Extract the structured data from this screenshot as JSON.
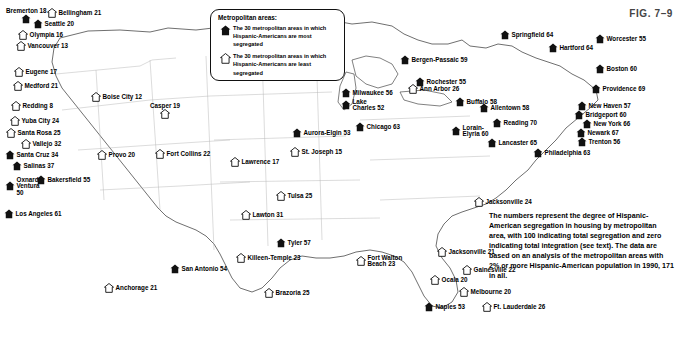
{
  "figure": {
    "label": "FIG. 7–9"
  },
  "legend": {
    "title": "Metropolitan areas:",
    "items": [
      {
        "icon": "house-icon-filled",
        "text": "The 30 metropolitan areas in which Hispanic-Americans are most segregated"
      },
      {
        "icon": "house-icon-outline",
        "text": "The 30 metropolitan areas in which Hispanic-Americans are least segregated"
      }
    ]
  },
  "note": "The numbers represent the degree of Hispanic-American segregation in housing by metropolitan area, with 100 indicating total segregation and zero indicating total integration (see text). The data are based on an analysis of the metropolitan areas with 2% or more Hispanic-American population in 1990, 171 in all.",
  "cities": [
    {
      "name": "Bremerton",
      "value": "18",
      "label": "Bremerton 18",
      "type": "filled",
      "x": 6,
      "y": 8,
      "pos": "below",
      "mx": 22,
      "my": 22
    },
    {
      "name": "Bellingham",
      "value": "21",
      "label": "Bellingham 21",
      "type": "outline",
      "x": 47,
      "y": 8,
      "pos": "right",
      "mx": 47,
      "my": 10
    },
    {
      "name": "Seattle",
      "value": "20",
      "label": "Seattle 20",
      "type": "filled",
      "x": 33,
      "y": 19,
      "pos": "right",
      "mx": 33,
      "my": 20
    },
    {
      "name": "Olympia",
      "value": "16",
      "label": "Olympia 16",
      "type": "outline",
      "x": 18,
      "y": 30,
      "pos": "right",
      "mx": 18,
      "my": 31
    },
    {
      "name": "Vancouver",
      "value": "13",
      "label": "Vancouver 13",
      "type": "outline",
      "x": 16,
      "y": 41,
      "pos": "right",
      "mx": 16,
      "my": 42
    },
    {
      "name": "Eugene",
      "value": "17",
      "label": "Eugene 17",
      "type": "outline",
      "x": 14,
      "y": 67,
      "pos": "right",
      "mx": 14,
      "my": 68
    },
    {
      "name": "Medford",
      "value": "21",
      "label": "Medford 21",
      "type": "outline",
      "x": 13,
      "y": 81,
      "pos": "right",
      "mx": 13,
      "my": 82
    },
    {
      "name": "Redding",
      "value": "8",
      "label": "Redding 8",
      "type": "outline",
      "x": 11,
      "y": 101,
      "pos": "right",
      "mx": 11,
      "my": 102
    },
    {
      "name": "Yuba City",
      "value": "24",
      "label": "Yuba City 24",
      "type": "outline",
      "x": 10,
      "y": 116,
      "pos": "right",
      "mx": 10,
      "my": 117
    },
    {
      "name": "Santa Rosa",
      "value": "25",
      "label": "Santa Rosa 25",
      "type": "outline",
      "x": 6,
      "y": 128,
      "pos": "right",
      "mx": 6,
      "my": 129
    },
    {
      "name": "Vallejo",
      "value": "32",
      "label": "Vallejo 32",
      "type": "outline",
      "x": 21,
      "y": 139,
      "pos": "right",
      "mx": 21,
      "my": 140
    },
    {
      "name": "Santa Cruz",
      "value": "34",
      "label": "Santa Cruz 34",
      "type": "filled",
      "x": 5,
      "y": 150,
      "pos": "right",
      "mx": 5,
      "my": 151
    },
    {
      "name": "Salinas",
      "value": "37",
      "label": "Salinas 37",
      "type": "filled",
      "x": 12,
      "y": 161,
      "pos": "right",
      "mx": 12,
      "my": 162
    },
    {
      "name": "Oxnard-Ventura",
      "value": "50",
      "label": "Oxnard-\nVentura\n50",
      "type": "filled",
      "x": 5,
      "y": 177,
      "pos": "right",
      "mx": 5,
      "my": 182
    },
    {
      "name": "Bakersfield",
      "value": "55",
      "label": "Bakersfield 55",
      "type": "filled",
      "x": 36,
      "y": 175,
      "pos": "right",
      "mx": 36,
      "my": 176
    },
    {
      "name": "Los Angeles",
      "value": "61",
      "label": "Los Angeles 61",
      "type": "filled",
      "x": 4,
      "y": 209,
      "pos": "right",
      "mx": 4,
      "my": 210
    },
    {
      "name": "Boise City",
      "value": "12",
      "label": "Boise City 12",
      "type": "outline",
      "x": 91,
      "y": 92,
      "pos": "right",
      "mx": 91,
      "my": 93
    },
    {
      "name": "Casper",
      "value": "19",
      "label": "Casper 19",
      "type": "outline",
      "x": 150,
      "y": 103,
      "pos": "below",
      "mx": 163,
      "my": 104
    },
    {
      "name": "Provo",
      "value": "20",
      "label": "Provo 20",
      "type": "outline",
      "x": 97,
      "y": 150,
      "pos": "right",
      "mx": 97,
      "my": 151
    },
    {
      "name": "Fort Collins",
      "value": "22",
      "label": "Fort Collins 22",
      "type": "outline",
      "x": 155,
      "y": 149,
      "pos": "right",
      "mx": 155,
      "my": 150
    },
    {
      "name": "Lawrence",
      "value": "17",
      "label": "Lawrence 17",
      "type": "outline",
      "x": 230,
      "y": 157,
      "pos": "right",
      "mx": 230,
      "my": 158
    },
    {
      "name": "St. Joseph",
      "value": "15",
      "label": "St. Joseph 15",
      "type": "outline",
      "x": 290,
      "y": 147,
      "pos": "right",
      "mx": 290,
      "my": 148
    },
    {
      "name": "Tulsa",
      "value": "25",
      "label": "Tulsa 25",
      "type": "outline",
      "x": 276,
      "y": 191,
      "pos": "right",
      "mx": 276,
      "my": 192
    },
    {
      "name": "Lawton",
      "value": "31",
      "label": "Lawton 31",
      "type": "outline",
      "x": 241,
      "y": 210,
      "pos": "right",
      "mx": 241,
      "my": 211
    },
    {
      "name": "Tyler",
      "value": "57",
      "label": "Tyler 57",
      "type": "filled",
      "x": 276,
      "y": 238,
      "pos": "right",
      "mx": 276,
      "my": 239
    },
    {
      "name": "Killeen-Temple",
      "value": "23",
      "label": "Killeen-Temple 23",
      "type": "outline",
      "x": 236,
      "y": 253,
      "pos": "right",
      "mx": 236,
      "my": 254
    },
    {
      "name": "San Antonio",
      "value": "54",
      "label": "San Antonio 54",
      "type": "filled",
      "x": 170,
      "y": 264,
      "pos": "right",
      "mx": 170,
      "my": 265
    },
    {
      "name": "Anchorage",
      "value": "21",
      "label": "Anchorage 21",
      "type": "outline",
      "x": 104,
      "y": 283,
      "pos": "right",
      "mx": 104,
      "my": 284
    },
    {
      "name": "Brazoria",
      "value": "25",
      "label": "Brazoria 25",
      "type": "outline",
      "x": 264,
      "y": 288,
      "pos": "right",
      "mx": 264,
      "my": 289
    },
    {
      "name": "Milwaukee",
      "value": "56",
      "label": "Milwaukee 56",
      "type": "filled",
      "x": 341,
      "y": 88,
      "pos": "right",
      "mx": 341,
      "my": 89
    },
    {
      "name": "Lake Charles",
      "value": "52",
      "label": "Lake\nCharles 52",
      "type": "filled",
      "x": 341,
      "y": 99,
      "pos": "right",
      "mx": 341,
      "my": 107
    },
    {
      "name": "Chicago",
      "value": "63",
      "label": "Chicago 63",
      "type": "filled",
      "x": 355,
      "y": 122,
      "pos": "right",
      "mx": 355,
      "my": 123
    },
    {
      "name": "Aurora-Elgin",
      "value": "53",
      "label": "Aurora-Elgin 53",
      "type": "filled",
      "x": 292,
      "y": 128,
      "pos": "right",
      "mx": 292,
      "my": 129
    },
    {
      "name": "Ann Arbor",
      "value": "26",
      "label": "Ann Arbor 26",
      "type": "outline",
      "x": 408,
      "y": 84,
      "pos": "right",
      "mx": 408,
      "my": 85
    },
    {
      "name": "Buffalo",
      "value": "58",
      "label": "Buffalo 58",
      "type": "filled",
      "x": 455,
      "y": 97,
      "pos": "right",
      "mx": 455,
      "my": 98
    },
    {
      "name": "Rochester",
      "value": "55",
      "label": "Rochester 55",
      "type": "filled",
      "x": 415,
      "y": 77,
      "pos": "right",
      "mx": 415,
      "my": 78
    },
    {
      "name": "Bergen-Passaic",
      "value": "59",
      "label": "Bergen-Passaic 59",
      "type": "filled",
      "x": 400,
      "y": 55,
      "pos": "right",
      "mx": 400,
      "my": 56
    },
    {
      "name": "Springfield",
      "value": "64",
      "label": "Springfield 64",
      "type": "filled",
      "x": 500,
      "y": 30,
      "pos": "right",
      "mx": 500,
      "my": 31
    },
    {
      "name": "Hartford",
      "value": "64",
      "label": "Hartford 64",
      "type": "filled",
      "x": 548,
      "y": 43,
      "pos": "right",
      "mx": 548,
      "my": 44
    },
    {
      "name": "Worcester",
      "value": "55",
      "label": "Worcester 55",
      "type": "filled",
      "x": 595,
      "y": 34,
      "pos": "right",
      "mx": 595,
      "my": 35
    },
    {
      "name": "Boston",
      "value": "60",
      "label": "Boston 60",
      "type": "filled",
      "x": 595,
      "y": 64,
      "pos": "right",
      "mx": 595,
      "my": 65
    },
    {
      "name": "Providence",
      "value": "69",
      "label": "Providence 69",
      "type": "filled",
      "x": 591,
      "y": 84,
      "pos": "right",
      "mx": 591,
      "my": 85
    },
    {
      "name": "Allentown",
      "value": "58",
      "label": "Allentown 58",
      "type": "filled",
      "x": 479,
      "y": 103,
      "pos": "right",
      "mx": 479,
      "my": 104
    },
    {
      "name": "New Haven",
      "value": "57",
      "label": "New Haven 57",
      "type": "filled",
      "x": 577,
      "y": 101,
      "pos": "right",
      "mx": 577,
      "my": 102
    },
    {
      "name": "Bridgeport",
      "value": "60",
      "label": "Bridgeport 60",
      "type": "filled",
      "x": 574,
      "y": 110,
      "pos": "right",
      "mx": 574,
      "my": 111
    },
    {
      "name": "New York",
      "value": "66",
      "label": "New York 66",
      "type": "filled",
      "x": 582,
      "y": 119,
      "pos": "right",
      "mx": 582,
      "my": 120
    },
    {
      "name": "Newark",
      "value": "67",
      "label": "Newark 67",
      "type": "filled",
      "x": 576,
      "y": 128,
      "pos": "right",
      "mx": 576,
      "my": 129
    },
    {
      "name": "Trenton",
      "value": "56",
      "label": "Trenton 56",
      "type": "filled",
      "x": 577,
      "y": 137,
      "pos": "right",
      "mx": 577,
      "my": 138
    },
    {
      "name": "Reading",
      "value": "70",
      "label": "Reading 70",
      "type": "filled",
      "x": 492,
      "y": 118,
      "pos": "right",
      "mx": 492,
      "my": 119
    },
    {
      "name": "Lorain-Elyria",
      "value": "60",
      "label": "Lorain-\nElyria 60",
      "type": "filled",
      "x": 451,
      "y": 125,
      "pos": "right",
      "mx": 451,
      "my": 133
    },
    {
      "name": "Lancaster",
      "value": "65",
      "label": "Lancaster 65",
      "type": "filled",
      "x": 487,
      "y": 138,
      "pos": "right",
      "mx": 487,
      "my": 139
    },
    {
      "name": "Philadelphia",
      "value": "63",
      "label": "Philadelphia 63",
      "type": "filled",
      "x": 533,
      "y": 148,
      "pos": "right",
      "mx": 533,
      "my": 149
    },
    {
      "name": "Jacksonville NC",
      "value": "24",
      "label": "Jacksonville 24",
      "type": "outline",
      "x": 474,
      "y": 197,
      "pos": "right",
      "mx": 474,
      "my": 198
    },
    {
      "name": "Jacksonville FL",
      "value": "21",
      "label": "Jacksonville 21",
      "type": "outline",
      "x": 437,
      "y": 247,
      "pos": "right",
      "mx": 437,
      "my": 248
    },
    {
      "name": "Fort Walton Beach",
      "value": "23",
      "label": "Fort Walton\nBeach 23",
      "type": "outline",
      "x": 356,
      "y": 255,
      "pos": "right",
      "mx": 356,
      "my": 263
    },
    {
      "name": "Ocala",
      "value": "20",
      "label": "Ocala 20",
      "type": "outline",
      "x": 430,
      "y": 275,
      "pos": "right",
      "mx": 430,
      "my": 276
    },
    {
      "name": "Gainesville",
      "value": "22",
      "label": "Gainesville 22",
      "type": "outline",
      "x": 462,
      "y": 265,
      "pos": "right",
      "mx": 462,
      "my": 266
    },
    {
      "name": "Melbourne",
      "value": "20",
      "label": "Melbourne 20",
      "type": "outline",
      "x": 459,
      "y": 287,
      "pos": "right",
      "mx": 459,
      "my": 288
    },
    {
      "name": "Naples",
      "value": "53",
      "label": "Naples 53",
      "type": "filled",
      "x": 424,
      "y": 302,
      "pos": "right",
      "mx": 424,
      "my": 303
    },
    {
      "name": "Ft. Lauderdale",
      "value": "26",
      "label": "Ft. Lauderdale 26",
      "type": "outline",
      "x": 482,
      "y": 302,
      "pos": "right",
      "mx": 482,
      "my": 303
    }
  ]
}
